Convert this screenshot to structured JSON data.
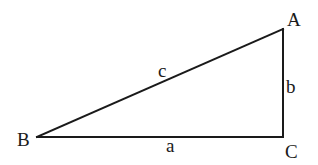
{
  "diagram": {
    "type": "right-triangle",
    "vertices": {
      "A": {
        "label": "A",
        "x": 283,
        "y": 29
      },
      "B": {
        "label": "B",
        "x": 37,
        "y": 137
      },
      "C": {
        "label": "C",
        "x": 283,
        "y": 137
      }
    },
    "sides": {
      "a": {
        "label": "a",
        "from": "B",
        "to": "C"
      },
      "b": {
        "label": "b",
        "from": "C",
        "to": "A"
      },
      "c": {
        "label": "c",
        "from": "B",
        "to": "A"
      }
    },
    "right_angle_at": "C",
    "line_color": "#1a1a1a",
    "background": "#ffffff"
  }
}
